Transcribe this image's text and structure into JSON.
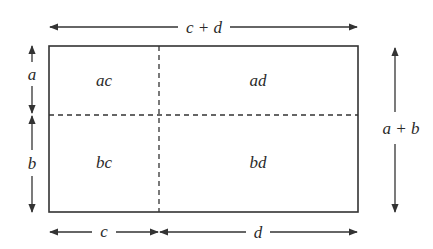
{
  "diagram": {
    "colors": {
      "stroke": "#333333",
      "text": "#2a2a2a",
      "background": "#ffffff"
    },
    "dimensions": {
      "top": "c + d",
      "right": "a + b",
      "left_top": "a",
      "left_bottom": "b",
      "bottom_left": "c",
      "bottom_right": "d"
    },
    "cells": {
      "top_left": "ac",
      "top_right": "ad",
      "bottom_left": "bc",
      "bottom_right": "bd"
    }
  }
}
